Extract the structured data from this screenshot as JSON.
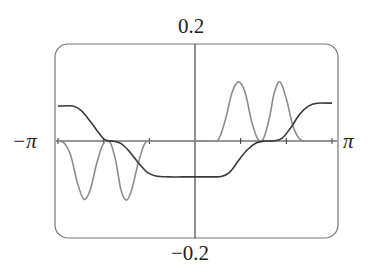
{
  "chart_data": {
    "type": "line",
    "title": "",
    "xlabel": "",
    "ylabel": "",
    "xlim": [
      -3.14159,
      3.14159
    ],
    "ylim": [
      -0.2,
      0.2
    ],
    "x_tick_labels": {
      "left": "−π",
      "right": "π"
    },
    "y_tick_labels": {
      "top": "0.2",
      "bottom": "−0.2"
    },
    "x_ticks": [
      -3.14159,
      -2.0944,
      -1.0472,
      1.0472,
      2.0944,
      3.14159
    ],
    "grid": false,
    "legend": null,
    "frame": "rounded",
    "series": [
      {
        "name": "dark-curve",
        "color": "#3a3a3a",
        "x": [
          -3.14,
          -2.8,
          -2.6,
          -2.4,
          -2.2,
          -2.1,
          -2.0,
          -1.9,
          -1.7,
          -1.5,
          -1.3,
          -1.1,
          -0.9,
          -0.6,
          -0.3,
          0.0,
          0.3,
          0.6,
          0.8,
          1.0,
          1.2,
          1.4,
          1.6,
          1.8,
          2.0,
          2.2,
          2.4,
          2.6,
          2.8,
          3.14
        ],
        "y": [
          0.072,
          0.072,
          0.062,
          0.04,
          0.016,
          0.005,
          0.0,
          0.0,
          -0.005,
          -0.022,
          -0.045,
          -0.064,
          -0.072,
          -0.074,
          -0.074,
          -0.074,
          -0.074,
          -0.073,
          -0.064,
          -0.04,
          -0.018,
          -0.004,
          0.0,
          0.0,
          0.006,
          0.028,
          0.055,
          0.072,
          0.078,
          0.078
        ]
      },
      {
        "name": "gray-curve",
        "color": "#8c8c8c",
        "x": [
          -3.14,
          -3.0,
          -2.85,
          -2.7,
          -2.55,
          -2.4,
          -2.25,
          -2.1,
          -1.95,
          -1.82,
          -1.7,
          -1.57,
          -1.45,
          -1.3,
          -1.15,
          -1.0,
          -0.85,
          -0.7,
          -0.55,
          -0.4,
          0.0,
          0.4,
          0.55,
          0.7,
          0.85,
          1.0,
          1.15,
          1.3,
          1.45,
          1.57,
          1.7,
          1.82,
          1.95,
          2.1,
          2.25,
          2.4,
          2.55,
          2.7,
          2.85,
          3.0,
          3.14
        ],
        "y": [
          0.0,
          -0.004,
          -0.03,
          -0.085,
          -0.12,
          -0.1,
          -0.045,
          -0.005,
          -0.002,
          -0.04,
          -0.1,
          -0.122,
          -0.1,
          -0.045,
          -0.005,
          0.0,
          0.0,
          0.0,
          0.0,
          0.0,
          0.0,
          0.0,
          0.005,
          0.045,
          0.1,
          0.122,
          0.1,
          0.04,
          0.002,
          0.005,
          0.045,
          0.1,
          0.122,
          0.085,
          0.03,
          0.004,
          0.0,
          0.0,
          0.0,
          0.0,
          0.0
        ]
      }
    ]
  },
  "labels": {
    "y_top": "0.2",
    "y_bottom": "−0.2",
    "x_left": "−π",
    "x_right": "π"
  }
}
